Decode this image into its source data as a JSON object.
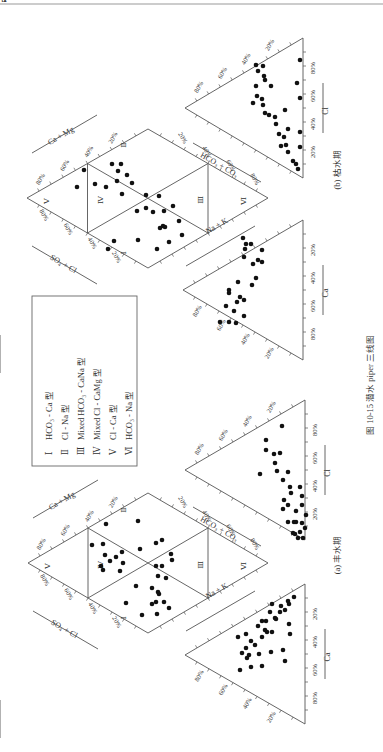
{
  "page": {
    "top_rule_color": "#9a9a9a",
    "caption": "图 10-15   潜水 piper 三线图",
    "legend": {
      "items": [
        {
          "roman": "Ⅰ",
          "label": "HCO₃ - Ca 型"
        },
        {
          "roman": "Ⅱ",
          "label": "Cl - Na 型"
        },
        {
          "roman": "Ⅲ",
          "label": "Mixed HCO₃ - CaNa 型"
        },
        {
          "roman": "Ⅳ",
          "label": "Mixed Cl - CaMg 型"
        },
        {
          "roman": "Ⅴ",
          "label": "Cl - Ca 型"
        },
        {
          "roman": "Ⅵ",
          "label": "HCO₃ - Na 型"
        }
      ]
    }
  },
  "chart_data": [
    {
      "type": "scatter",
      "subtype": "piper-trilinear",
      "title": "(b) 枯水期",
      "axes": {
        "diamond": {
          "top_left": "Ca + Mg",
          "bottom_left": "SO₄ + Cl",
          "top_right": "HCO₃ + CO₃",
          "bottom_right": "Na + K"
        },
        "anion_triangle": {
          "axis_1": "SO₄",
          "axis_2": "Cl"
        },
        "cation_triangle": {
          "axis_1": "Mg",
          "axis_2": "Ca"
        }
      },
      "tick_labels": [
        "20%",
        "40%",
        "60%",
        "80%"
      ],
      "zone_labels": [
        "Ⅰ",
        "Ⅱ",
        "Ⅲ",
        "Ⅳ",
        "Ⅴ",
        "Ⅵ"
      ],
      "geometry": {
        "diamond": [
          [
            27,
            198
          ],
          [
            148,
            129
          ],
          [
            268,
            198
          ],
          [
            148,
            268
          ]
        ],
        "anion": [
          [
            185,
            108
          ],
          [
            303,
            38
          ],
          [
            303,
            178
          ]
        ],
        "cation": [
          [
            183,
            290
          ],
          [
            303,
            220
          ],
          [
            303,
            360
          ]
        ]
      },
      "points": {
        "diamond": [
          [
            77,
            187
          ],
          [
            84,
            170
          ],
          [
            95,
            184
          ],
          [
            106,
            187
          ],
          [
            118,
            171
          ],
          [
            112,
            164
          ],
          [
            117,
            181
          ],
          [
            121,
            164
          ],
          [
            127,
            175
          ],
          [
            122,
            194
          ],
          [
            132,
            183
          ],
          [
            146,
            195
          ],
          [
            146,
            208
          ],
          [
            137,
            211
          ],
          [
            159,
            196
          ],
          [
            153,
            212
          ],
          [
            163,
            226
          ],
          [
            164,
            211
          ],
          [
            173,
            206
          ],
          [
            160,
            228
          ],
          [
            138,
            240
          ],
          [
            165,
            227
          ],
          [
            179,
            221
          ],
          [
            182,
            235
          ],
          [
            114,
            241
          ],
          [
            108,
            249
          ],
          [
            157,
            249
          ],
          [
            169,
            242
          ]
        ],
        "anion": [
          [
            256,
            65
          ],
          [
            258,
            71
          ],
          [
            263,
            66
          ],
          [
            264,
            76
          ],
          [
            265,
            80
          ],
          [
            256,
            86
          ],
          [
            257,
            96
          ],
          [
            262,
            99
          ],
          [
            253,
            103
          ],
          [
            263,
            105
          ],
          [
            271,
            86
          ],
          [
            265,
            113
          ],
          [
            269,
            115
          ],
          [
            275,
            117
          ],
          [
            285,
            110
          ],
          [
            276,
            124
          ],
          [
            279,
            134
          ],
          [
            284,
            137
          ],
          [
            288,
            129
          ],
          [
            281,
            146
          ],
          [
            286,
            145
          ],
          [
            296,
            164
          ],
          [
            300,
            132
          ],
          [
            300,
            147
          ],
          [
            298,
            169
          ],
          [
            293,
            161
          ],
          [
            288,
            152
          ],
          [
            300,
            98
          ],
          [
            300,
            60
          ],
          [
            297,
            83
          ]
        ],
        "cation": [
          [
            243,
            238
          ],
          [
            245,
            249
          ],
          [
            246,
            244
          ],
          [
            251,
            244
          ],
          [
            244,
            257
          ],
          [
            262,
            250
          ],
          [
            253,
            264
          ],
          [
            258,
            260
          ],
          [
            262,
            262
          ],
          [
            252,
            285
          ],
          [
            256,
            278
          ],
          [
            238,
            282
          ],
          [
            240,
            297
          ],
          [
            244,
            300
          ],
          [
            244,
            316
          ],
          [
            236,
            323
          ],
          [
            237,
            302
          ],
          [
            229,
            290
          ],
          [
            229,
            293
          ],
          [
            226,
            306
          ],
          [
            220,
            322
          ],
          [
            229,
            322
          ],
          [
            234,
            311
          ]
        ]
      }
    },
    {
      "type": "scatter",
      "subtype": "piper-trilinear",
      "title": "(a) 丰水期",
      "axes": {
        "diamond": {
          "top_left": "Ca + Mg",
          "bottom_left": "SO₄ + Cl",
          "top_right": "HCO₃ + CO₃",
          "bottom_right": "Na + K"
        },
        "anion_triangle": {
          "axis_1": "SO₄",
          "axis_2": "Cl"
        },
        "cation_triangle": {
          "axis_1": "Mg",
          "axis_2": "Ca"
        }
      },
      "tick_labels": [
        "20%",
        "40%",
        "60%",
        "80%"
      ],
      "zone_labels": [
        "Ⅰ",
        "Ⅱ",
        "Ⅲ",
        "Ⅳ",
        "Ⅴ",
        "Ⅵ"
      ],
      "geometry": {
        "diamond": [
          [
            28,
            563
          ],
          [
            148,
            493
          ],
          [
            268,
            563
          ],
          [
            148,
            633
          ]
        ],
        "anion": [
          [
            185,
            470
          ],
          [
            305,
            400
          ],
          [
            305,
            540
          ]
        ],
        "cation": [
          [
            185,
            655
          ],
          [
            305,
            584
          ],
          [
            305,
            724
          ]
        ]
      },
      "points": {
        "diamond": [
          [
            138,
            521
          ],
          [
            106,
            524
          ],
          [
            103,
            544
          ],
          [
            92,
            545
          ],
          [
            105,
            555
          ],
          [
            122,
            552
          ],
          [
            116,
            557
          ],
          [
            123,
            563
          ],
          [
            110,
            561
          ],
          [
            120,
            571
          ],
          [
            103,
            570
          ],
          [
            101,
            566
          ],
          [
            156,
            543
          ],
          [
            162,
            540
          ],
          [
            140,
            549
          ],
          [
            171,
            554
          ],
          [
            172,
            560
          ],
          [
            162,
            566
          ],
          [
            156,
            566
          ],
          [
            158,
            576
          ],
          [
            166,
            578
          ],
          [
            158,
            592
          ],
          [
            152,
            588
          ],
          [
            159,
            594
          ],
          [
            164,
            602
          ],
          [
            152,
            604
          ],
          [
            142,
            615
          ],
          [
            157,
            614
          ],
          [
            169,
            608
          ],
          [
            136,
            586
          ],
          [
            126,
            603
          ],
          [
            156,
            602
          ]
        ],
        "anion": [
          [
            282,
            426
          ],
          [
            266,
            440
          ],
          [
            266,
            450
          ],
          [
            274,
            454
          ],
          [
            275,
            463
          ],
          [
            280,
            453
          ],
          [
            277,
            471
          ],
          [
            288,
            472
          ],
          [
            283,
            480
          ],
          [
            260,
            474
          ],
          [
            290,
            487
          ],
          [
            291,
            493
          ],
          [
            300,
            487
          ],
          [
            302,
            496
          ],
          [
            284,
            500
          ],
          [
            288,
            505
          ],
          [
            283,
            509
          ],
          [
            302,
            505
          ],
          [
            296,
            511
          ],
          [
            306,
            515
          ],
          [
            288,
            522
          ],
          [
            294,
            522
          ],
          [
            296,
            522
          ],
          [
            302,
            523
          ],
          [
            293,
            533
          ],
          [
            295,
            534
          ],
          [
            300,
            532
          ],
          [
            305,
            528
          ],
          [
            298,
            538
          ],
          [
            303,
            538
          ]
        ],
        "cation": [
          [
            294,
            597
          ],
          [
            288,
            601
          ],
          [
            289,
            604
          ],
          [
            285,
            610
          ],
          [
            281,
            606
          ],
          [
            280,
            612
          ],
          [
            272,
            604
          ],
          [
            270,
            612
          ],
          [
            275,
            618
          ],
          [
            276,
            619
          ],
          [
            266,
            621
          ],
          [
            262,
            621
          ],
          [
            265,
            630
          ],
          [
            258,
            626
          ],
          [
            262,
            637
          ],
          [
            267,
            632
          ],
          [
            272,
            632
          ],
          [
            251,
            641
          ],
          [
            255,
            645
          ],
          [
            246,
            634
          ],
          [
            246,
            648
          ],
          [
            242,
            653
          ],
          [
            249,
            655
          ],
          [
            247,
            658
          ],
          [
            259,
            654
          ],
          [
            271,
            652
          ],
          [
            251,
            667
          ],
          [
            262,
            666
          ],
          [
            283,
            650
          ],
          [
            285,
            661
          ],
          [
            290,
            634
          ],
          [
            289,
            624
          ],
          [
            240,
            670
          ],
          [
            238,
            637
          ]
        ]
      }
    }
  ]
}
